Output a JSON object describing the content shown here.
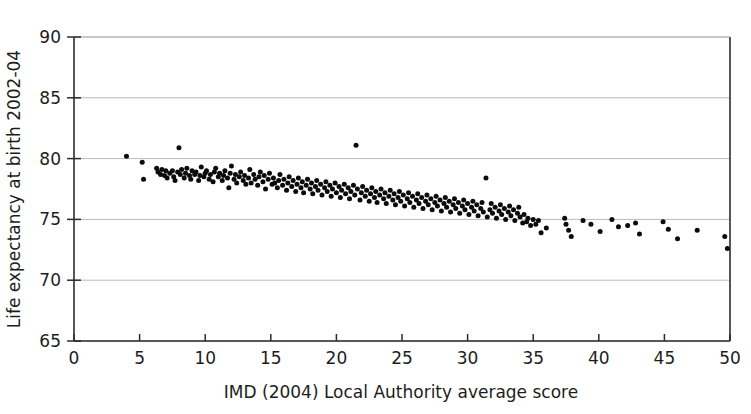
{
  "chart_data": {
    "type": "scatter",
    "title": "",
    "xlabel": "IMD (2004) Local Authority average score",
    "ylabel": "Life expectancy at birth 2002-04",
    "xlim": [
      0,
      50
    ],
    "ylim": [
      65,
      90
    ],
    "xticks": [
      0,
      5,
      10,
      15,
      20,
      25,
      30,
      35,
      40,
      45,
      50
    ],
    "yticks": [
      65,
      70,
      75,
      80,
      85,
      90
    ],
    "xtick_labels": [
      "0",
      "5",
      "10",
      "15",
      "20",
      "25",
      "30",
      "35",
      "40",
      "45",
      "50"
    ],
    "ytick_labels": [
      "65",
      "70",
      "75",
      "80",
      "85",
      "90"
    ],
    "grid": "horizontal",
    "legend": "none",
    "marker": {
      "shape": "circle",
      "color": "#0b0b0b",
      "size_px": 5
    },
    "series": [
      {
        "name": "Local Authorities",
        "points": [
          [
            4.0,
            80.2
          ],
          [
            5.2,
            79.7
          ],
          [
            5.3,
            78.3
          ],
          [
            6.3,
            79.2
          ],
          [
            6.4,
            78.9
          ],
          [
            6.6,
            78.7
          ],
          [
            6.7,
            79.1
          ],
          [
            6.9,
            78.6
          ],
          [
            7.0,
            79.0
          ],
          [
            7.1,
            78.4
          ],
          [
            7.3,
            78.8
          ],
          [
            7.5,
            79.0
          ],
          [
            7.6,
            78.5
          ],
          [
            7.7,
            78.2
          ],
          [
            7.9,
            78.9
          ],
          [
            8.0,
            80.9
          ],
          [
            8.1,
            78.7
          ],
          [
            8.2,
            79.1
          ],
          [
            8.4,
            78.4
          ],
          [
            8.5,
            78.8
          ],
          [
            8.6,
            79.2
          ],
          [
            8.8,
            78.6
          ],
          [
            8.9,
            78.3
          ],
          [
            9.0,
            79.0
          ],
          [
            9.2,
            78.7
          ],
          [
            9.3,
            78.9
          ],
          [
            9.5,
            78.2
          ],
          [
            9.6,
            78.6
          ],
          [
            9.7,
            79.3
          ],
          [
            9.9,
            78.5
          ],
          [
            10.0,
            78.8
          ],
          [
            10.1,
            79.0
          ],
          [
            10.3,
            78.3
          ],
          [
            10.4,
            78.7
          ],
          [
            10.6,
            78.1
          ],
          [
            10.7,
            78.9
          ],
          [
            10.8,
            79.2
          ],
          [
            11.0,
            78.5
          ],
          [
            11.1,
            78.8
          ],
          [
            11.3,
            78.2
          ],
          [
            11.4,
            78.6
          ],
          [
            11.5,
            79.0
          ],
          [
            11.7,
            78.4
          ],
          [
            11.8,
            77.6
          ],
          [
            11.9,
            78.8
          ],
          [
            12.0,
            79.4
          ],
          [
            12.2,
            78.3
          ],
          [
            12.3,
            78.7
          ],
          [
            12.4,
            78.0
          ],
          [
            12.6,
            78.5
          ],
          [
            12.7,
            78.9
          ],
          [
            12.9,
            78.2
          ],
          [
            13.0,
            78.6
          ],
          [
            13.1,
            77.9
          ],
          [
            13.3,
            78.4
          ],
          [
            13.4,
            79.1
          ],
          [
            13.5,
            78.0
          ],
          [
            13.7,
            78.7
          ],
          [
            13.8,
            78.3
          ],
          [
            14.0,
            77.8
          ],
          [
            14.1,
            78.5
          ],
          [
            14.2,
            78.9
          ],
          [
            14.4,
            78.1
          ],
          [
            14.5,
            78.6
          ],
          [
            14.6,
            77.5
          ],
          [
            14.8,
            78.3
          ],
          [
            14.9,
            78.8
          ],
          [
            15.1,
            77.9
          ],
          [
            15.2,
            78.4
          ],
          [
            15.3,
            78.0
          ],
          [
            15.5,
            77.6
          ],
          [
            15.6,
            78.2
          ],
          [
            15.7,
            78.7
          ],
          [
            15.9,
            77.8
          ],
          [
            16.0,
            78.3
          ],
          [
            16.2,
            77.4
          ],
          [
            16.3,
            78.0
          ],
          [
            16.4,
            78.5
          ],
          [
            16.6,
            77.7
          ],
          [
            16.7,
            78.2
          ],
          [
            16.9,
            77.3
          ],
          [
            17.0,
            77.9
          ],
          [
            17.1,
            78.4
          ],
          [
            17.3,
            77.6
          ],
          [
            17.4,
            78.1
          ],
          [
            17.5,
            77.2
          ],
          [
            17.7,
            77.8
          ],
          [
            17.8,
            78.3
          ],
          [
            18.0,
            77.5
          ],
          [
            18.1,
            78.0
          ],
          [
            18.2,
            77.1
          ],
          [
            18.4,
            77.7
          ],
          [
            18.5,
            78.2
          ],
          [
            18.6,
            77.4
          ],
          [
            18.8,
            77.9
          ],
          [
            18.9,
            77.0
          ],
          [
            19.1,
            77.6
          ],
          [
            19.2,
            78.1
          ],
          [
            19.3,
            77.3
          ],
          [
            19.5,
            77.8
          ],
          [
            19.6,
            76.9
          ],
          [
            19.7,
            77.5
          ],
          [
            19.9,
            78.0
          ],
          [
            20.0,
            77.2
          ],
          [
            20.2,
            77.7
          ],
          [
            20.3,
            76.8
          ],
          [
            20.4,
            77.4
          ],
          [
            20.6,
            77.9
          ],
          [
            20.7,
            77.1
          ],
          [
            20.9,
            77.6
          ],
          [
            21.0,
            76.7
          ],
          [
            21.1,
            77.3
          ],
          [
            21.3,
            77.8
          ],
          [
            21.4,
            77.0
          ],
          [
            21.5,
            81.1
          ],
          [
            21.6,
            77.5
          ],
          [
            21.8,
            76.6
          ],
          [
            21.9,
            77.2
          ],
          [
            22.0,
            77.7
          ],
          [
            22.2,
            76.9
          ],
          [
            22.3,
            77.4
          ],
          [
            22.5,
            76.5
          ],
          [
            22.6,
            77.1
          ],
          [
            22.7,
            77.6
          ],
          [
            22.9,
            76.8
          ],
          [
            23.0,
            77.3
          ],
          [
            23.1,
            76.4
          ],
          [
            23.3,
            77.0
          ],
          [
            23.4,
            77.5
          ],
          [
            23.6,
            76.7
          ],
          [
            23.7,
            77.2
          ],
          [
            23.8,
            76.3
          ],
          [
            24.0,
            76.9
          ],
          [
            24.1,
            77.4
          ],
          [
            24.3,
            76.6
          ],
          [
            24.4,
            77.1
          ],
          [
            24.5,
            76.2
          ],
          [
            24.7,
            76.8
          ],
          [
            24.8,
            77.3
          ],
          [
            24.9,
            76.5
          ],
          [
            25.1,
            77.0
          ],
          [
            25.2,
            76.1
          ],
          [
            25.4,
            76.7
          ],
          [
            25.5,
            77.2
          ],
          [
            25.6,
            76.4
          ],
          [
            25.8,
            76.9
          ],
          [
            25.9,
            76.0
          ],
          [
            26.1,
            76.6
          ],
          [
            26.2,
            77.1
          ],
          [
            26.3,
            76.3
          ],
          [
            26.5,
            76.8
          ],
          [
            26.6,
            75.9
          ],
          [
            26.8,
            76.5
          ],
          [
            26.9,
            77.0
          ],
          [
            27.0,
            76.2
          ],
          [
            27.2,
            76.7
          ],
          [
            27.3,
            75.8
          ],
          [
            27.5,
            76.4
          ],
          [
            27.6,
            76.9
          ],
          [
            27.7,
            76.1
          ],
          [
            27.9,
            76.6
          ],
          [
            28.0,
            75.7
          ],
          [
            28.2,
            76.3
          ],
          [
            28.3,
            76.8
          ],
          [
            28.4,
            76.0
          ],
          [
            28.6,
            76.5
          ],
          [
            28.7,
            75.6
          ],
          [
            28.9,
            76.2
          ],
          [
            29.0,
            76.7
          ],
          [
            29.1,
            75.9
          ],
          [
            29.3,
            76.4
          ],
          [
            29.4,
            75.5
          ],
          [
            29.6,
            76.1
          ],
          [
            29.7,
            76.6
          ],
          [
            29.8,
            75.8
          ],
          [
            30.0,
            76.3
          ],
          [
            30.1,
            75.4
          ],
          [
            30.3,
            76.0
          ],
          [
            30.4,
            76.5
          ],
          [
            30.5,
            75.7
          ],
          [
            30.7,
            76.2
          ],
          [
            30.8,
            75.3
          ],
          [
            31.0,
            75.9
          ],
          [
            31.1,
            76.4
          ],
          [
            31.2,
            75.6
          ],
          [
            31.4,
            78.4
          ],
          [
            31.5,
            75.2
          ],
          [
            31.7,
            75.8
          ],
          [
            31.8,
            76.3
          ],
          [
            31.9,
            75.5
          ],
          [
            32.1,
            76.0
          ],
          [
            32.2,
            75.1
          ],
          [
            32.4,
            75.7
          ],
          [
            32.5,
            76.2
          ],
          [
            32.6,
            75.4
          ],
          [
            32.8,
            75.9
          ],
          [
            32.9,
            75.0
          ],
          [
            33.1,
            75.6
          ],
          [
            33.2,
            76.1
          ],
          [
            33.3,
            75.3
          ],
          [
            33.5,
            75.8
          ],
          [
            33.6,
            74.9
          ],
          [
            33.8,
            75.5
          ],
          [
            33.9,
            76.0
          ],
          [
            34.0,
            75.2
          ],
          [
            34.2,
            74.7
          ],
          [
            34.3,
            75.4
          ],
          [
            34.5,
            74.8
          ],
          [
            34.6,
            75.1
          ],
          [
            34.8,
            74.5
          ],
          [
            35.0,
            75.0
          ],
          [
            35.2,
            74.6
          ],
          [
            35.4,
            74.9
          ],
          [
            35.6,
            73.9
          ],
          [
            36.0,
            74.3
          ],
          [
            37.4,
            75.1
          ],
          [
            37.5,
            74.6
          ],
          [
            37.7,
            74.1
          ],
          [
            37.9,
            73.6
          ],
          [
            38.8,
            74.9
          ],
          [
            39.4,
            74.6
          ],
          [
            40.1,
            74.0
          ],
          [
            41.0,
            75.0
          ],
          [
            41.5,
            74.4
          ],
          [
            42.2,
            74.5
          ],
          [
            42.8,
            74.7
          ],
          [
            43.1,
            73.8
          ],
          [
            44.9,
            74.8
          ],
          [
            45.3,
            74.2
          ],
          [
            46.0,
            73.4
          ],
          [
            47.5,
            74.1
          ],
          [
            49.6,
            73.6
          ],
          [
            49.8,
            72.6
          ]
        ]
      }
    ]
  },
  "axes": {
    "x_axis_title": "IMD (2004) Local Authority average score",
    "y_axis_title": "Life expectancy at birth 2002-04"
  }
}
